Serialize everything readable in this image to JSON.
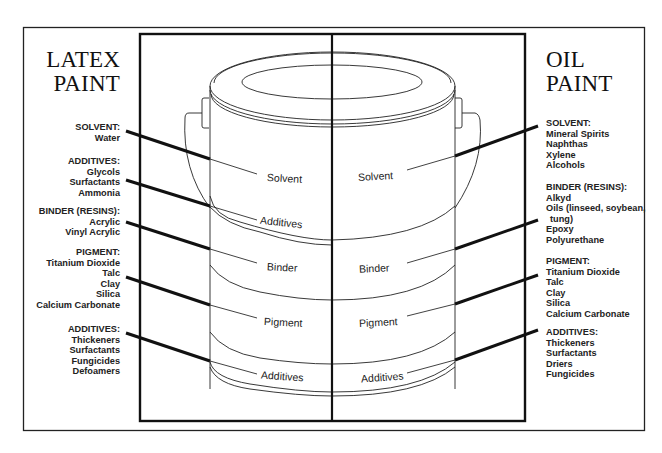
{
  "latex": {
    "title_line1": "LATEX",
    "title_line2": "PAINT",
    "groups": [
      {
        "heading": "SOLVENT:",
        "items": [
          "Water"
        ]
      },
      {
        "heading": "ADDITIVES:",
        "items": [
          "Glycols",
          "Surfactants",
          "Ammonia"
        ]
      },
      {
        "heading": "BINDER (RESINS):",
        "items": [
          "Acrylic",
          "Vinyl Acrylic"
        ]
      },
      {
        "heading": "PIGMENT:",
        "items": [
          "Titanium Dioxide",
          "Talc",
          "Clay",
          "Silica",
          "Calcium Carbonate"
        ]
      },
      {
        "heading": "ADDITIVES:",
        "items": [
          "Thickeners",
          "Surfactants",
          "Fungicides",
          "Defoamers"
        ]
      }
    ],
    "layers": [
      "Solvent",
      "Additives",
      "Binder",
      "Pigment",
      "Additives"
    ]
  },
  "oil": {
    "title_line1": "OIL",
    "title_line2": "PAINT",
    "groups": [
      {
        "heading": "SOLVENT:",
        "items": [
          "Mineral Spirits",
          "Naphthas",
          "Xylene",
          "Alcohols"
        ]
      },
      {
        "heading": "BINDER (RESINS):",
        "items": [
          "Alkyd",
          "Oils (linseed, soybean,",
          "tung)",
          "Epoxy",
          "Polyurethane"
        ]
      },
      {
        "heading": "PIGMENT:",
        "items": [
          "Titanium Dioxide",
          "Talc",
          "Clay",
          "Silica",
          "Calcium Carbonate"
        ]
      },
      {
        "heading": "ADDITIVES:",
        "items": [
          "Thickeners",
          "Surfactants",
          "Driers",
          "Fungicides"
        ]
      }
    ],
    "layers": [
      "Solvent",
      "Binder",
      "Pigment",
      "Additives"
    ]
  },
  "colors": {
    "ink": "#111111",
    "background": "#ffffff"
  }
}
